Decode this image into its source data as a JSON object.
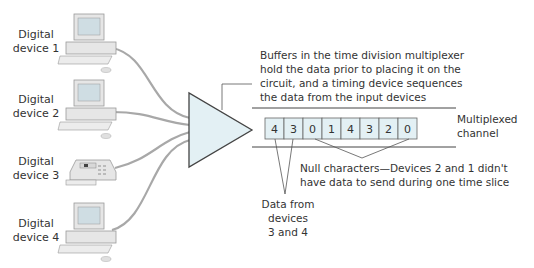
{
  "devices": [
    {
      "label_line1": "Digital",
      "label_line2": "device 1",
      "type": "computer"
    },
    {
      "label_line1": "Digital",
      "label_line2": "device 2",
      "type": "computer"
    },
    {
      "label_line1": "Digital",
      "label_line2": "device 3",
      "type": "telephone"
    },
    {
      "label_line1": "Digital",
      "label_line2": "device 4",
      "type": "computer"
    }
  ],
  "multiplexer": {
    "note_lines": [
      "Buffers in the time division multiplexer",
      "hold the data prior to placing it on the",
      "circuit, and a timing device sequences",
      "the data from the input devices"
    ],
    "fill": "#e3f0f4"
  },
  "channel": {
    "label_line1": "Multiplexed",
    "label_line2": "channel",
    "cells": [
      "4",
      "3",
      "0",
      "1",
      "4",
      "3",
      "2",
      "0"
    ],
    "cell_fill": "#e3f0f4"
  },
  "annotations": {
    "null_line1": "Null characters—Devices 2 and 1 didn't",
    "null_line2": "have data to send during one time slice",
    "data_line1": "Data from",
    "data_line2": "devices",
    "data_line3": "3 and 4"
  },
  "colors": {
    "cable": "#a8a8a8",
    "line": "#555555",
    "device_body": "#e6e6e6",
    "screen": "#cfdde3"
  }
}
